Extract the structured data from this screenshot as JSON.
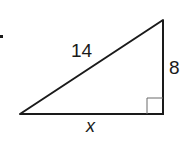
{
  "diagram": {
    "type": "right-triangle",
    "labels": {
      "hypotenuse": "14",
      "vertical_leg": "8",
      "horizontal_leg": "x"
    },
    "vertices": {
      "left": [
        20,
        114
      ],
      "top_right": [
        163,
        20
      ],
      "bottom_right": [
        163,
        114
      ]
    },
    "right_angle_at": "bottom_right",
    "stroke_color": "#1a1a1a",
    "right_angle_mark_color": "#6b6b6b",
    "bullet_marker": "•"
  }
}
